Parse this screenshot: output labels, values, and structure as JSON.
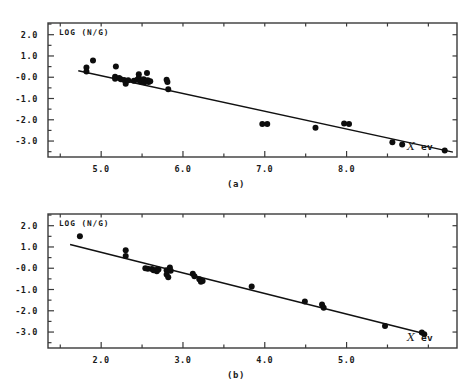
{
  "figure": {
    "background_color": "#ffffff",
    "ink_color": "#111111"
  },
  "panels": [
    {
      "id": "a",
      "caption": "(a)",
      "y_axis_note": "LOG (N/G)",
      "x_axis_title_symbol": "X",
      "x_axis_title_unit": "ev",
      "chart_data": {
        "type": "scatter",
        "title": "",
        "subtitle": "",
        "xlabel": "X ev",
        "ylabel": "LOG (N/G)",
        "grid": false,
        "legend": "none",
        "xlim": [
          4.35,
          9.35
        ],
        "ylim": [
          -3.75,
          2.55
        ],
        "xticks": [
          5.0,
          6.0,
          7.0,
          8.0
        ],
        "xtick_labels": [
          "5.0",
          "6.0",
          "7.0",
          "8.0"
        ],
        "xminorticks": [
          4.5,
          5.5,
          6.5,
          7.5,
          8.5,
          9.0
        ],
        "yticks": [
          2.0,
          1.0,
          -0.0,
          -1.0,
          -2.0,
          -3.0
        ],
        "ytick_labels": [
          "2.0",
          "1.0",
          "-0.0",
          "-1.0",
          "-2.0",
          "-3.0"
        ],
        "series": [
          {
            "name": "data",
            "marker": "filled-circle",
            "points": [
              [
                4.82,
                0.46
              ],
              [
                4.82,
                0.27
              ],
              [
                4.9,
                0.79
              ],
              [
                5.18,
                0.5
              ],
              [
                5.17,
                0.02
              ],
              [
                5.17,
                -0.07
              ],
              [
                5.22,
                -0.04
              ],
              [
                5.24,
                -0.1
              ],
              [
                5.28,
                -0.13
              ],
              [
                5.3,
                -0.31
              ],
              [
                5.33,
                -0.14
              ],
              [
                5.4,
                -0.16
              ],
              [
                5.44,
                -0.12
              ],
              [
                5.46,
                0.14
              ],
              [
                5.46,
                -0.02
              ],
              [
                5.48,
                -0.2
              ],
              [
                5.5,
                -0.18
              ],
              [
                5.52,
                -0.1
              ],
              [
                5.53,
                -0.24
              ],
              [
                5.55,
                -0.17
              ],
              [
                5.56,
                0.2
              ],
              [
                5.57,
                -0.14
              ],
              [
                5.58,
                -0.22
              ],
              [
                5.6,
                -0.19
              ],
              [
                5.8,
                -0.12
              ],
              [
                5.81,
                -0.22
              ],
              [
                5.82,
                -0.56
              ],
              [
                6.97,
                -2.2
              ],
              [
                7.03,
                -2.2
              ],
              [
                7.62,
                -2.38
              ],
              [
                7.97,
                -2.18
              ],
              [
                8.03,
                -2.2
              ],
              [
                8.56,
                -3.06
              ],
              [
                8.68,
                -3.16
              ],
              [
                9.2,
                -3.44
              ]
            ]
          }
        ],
        "fit_line": {
          "name": "least-squares fit",
          "x_start": 4.72,
          "y_start": 0.31,
          "x_end": 9.3,
          "y_end": -3.52
        }
      }
    },
    {
      "id": "b",
      "caption": "(b)",
      "y_axis_note": "LOG (N/G)",
      "x_axis_title_symbol": "X",
      "x_axis_title_unit": "ev",
      "chart_data": {
        "type": "scatter",
        "title": "",
        "subtitle": "",
        "xlabel": "X ev",
        "ylabel": "LOG (N/G)",
        "grid": false,
        "legend": "none",
        "xlim": [
          1.35,
          6.35
        ],
        "ylim": [
          -3.75,
          2.55
        ],
        "xticks": [
          2.0,
          3.0,
          4.0,
          5.0
        ],
        "xtick_labels": [
          "2.0",
          "3.0",
          "4.0",
          "5.0"
        ],
        "xminorticks": [
          1.5,
          2.5,
          3.5,
          4.5,
          5.5,
          6.0
        ],
        "yticks": [
          2.0,
          1.0,
          -0.0,
          -1.0,
          -2.0,
          -3.0
        ],
        "ytick_labels": [
          "2.0",
          "1.0",
          "-0.0",
          "-1.0",
          "-2.0",
          "-3.0"
        ],
        "series": [
          {
            "name": "data",
            "marker": "filled-circle",
            "points": [
              [
                1.74,
                1.5
              ],
              [
                2.3,
                0.84
              ],
              [
                2.3,
                0.58
              ],
              [
                2.54,
                0.0
              ],
              [
                2.57,
                -0.02
              ],
              [
                2.62,
                -0.04
              ],
              [
                2.64,
                -0.1
              ],
              [
                2.67,
                -0.08
              ],
              [
                2.68,
                -0.14
              ],
              [
                2.7,
                -0.06
              ],
              [
                2.8,
                -0.1
              ],
              [
                2.8,
                -0.3
              ],
              [
                2.82,
                -0.42
              ],
              [
                2.84,
                0.04
              ],
              [
                2.85,
                -0.12
              ],
              [
                3.12,
                -0.26
              ],
              [
                3.14,
                -0.38
              ],
              [
                3.2,
                -0.52
              ],
              [
                3.22,
                -0.64
              ],
              [
                3.24,
                -0.6
              ],
              [
                3.84,
                -0.86
              ],
              [
                4.49,
                -1.56
              ],
              [
                4.7,
                -1.7
              ],
              [
                4.72,
                -1.86
              ],
              [
                5.47,
                -2.72
              ],
              [
                5.92,
                -3.02
              ],
              [
                5.95,
                -3.1
              ]
            ]
          }
        ],
        "fit_line": {
          "name": "least-squares fit",
          "x_start": 1.62,
          "y_start": 1.12,
          "x_end": 5.98,
          "y_end": -3.1
        }
      }
    }
  ]
}
